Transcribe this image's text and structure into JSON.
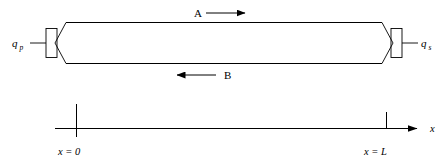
{
  "figure": {
    "colors": {
      "stroke": "#000000",
      "background": "#ffffff"
    }
  },
  "ports": {
    "left": {
      "symbol": "q",
      "subscript": "p",
      "name": "left-port-label"
    },
    "right": {
      "symbol": "q",
      "subscript": "s",
      "name": "right-port-label"
    }
  },
  "flows": [
    {
      "label": "A",
      "direction": "right",
      "position": "above-tube"
    },
    {
      "label": "B",
      "direction": "left",
      "position": "below-tube"
    }
  ],
  "axis": {
    "label": "x",
    "ticks": [
      {
        "label_x": "x",
        "label_eq": "=",
        "label_value": "0",
        "full": "x = 0"
      },
      {
        "label_x": "x",
        "label_eq": "=",
        "label_value": "L",
        "full": "x = L"
      }
    ]
  }
}
